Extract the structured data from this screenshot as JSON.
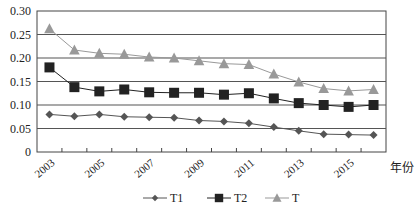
{
  "chart_data": {
    "type": "line",
    "title": "",
    "xlabel": "年份",
    "ylabel": "",
    "ylim": [
      0,
      0.3
    ],
    "yticks": [
      "0",
      "0.05",
      "0.10",
      "0.15",
      "0.20",
      "0.25",
      "0.30"
    ],
    "ytick_values": [
      0,
      0.05,
      0.1,
      0.15,
      0.2,
      0.25,
      0.3
    ],
    "x": [
      2003,
      2004,
      2005,
      2006,
      2007,
      2008,
      2009,
      2010,
      2011,
      2012,
      2013,
      2014,
      2015,
      2016
    ],
    "xtick_labels": [
      "2003",
      "2005",
      "2007",
      "2009",
      "2011",
      "2013",
      "2015"
    ],
    "grid": "horizontal",
    "legend_position": "bottom",
    "series": [
      {
        "name": "T1",
        "marker": "diamond",
        "color": "#555555",
        "values": [
          0.08,
          0.076,
          0.08,
          0.075,
          0.074,
          0.073,
          0.067,
          0.065,
          0.061,
          0.053,
          0.045,
          0.038,
          0.037,
          0.036
        ]
      },
      {
        "name": "T2",
        "marker": "square",
        "color": "#222222",
        "values": [
          0.18,
          0.138,
          0.129,
          0.133,
          0.127,
          0.126,
          0.126,
          0.122,
          0.125,
          0.114,
          0.104,
          0.1,
          0.096,
          0.1
        ]
      },
      {
        "name": "T",
        "marker": "triangle",
        "color": "#999999",
        "values": [
          0.262,
          0.217,
          0.21,
          0.208,
          0.202,
          0.2,
          0.194,
          0.188,
          0.186,
          0.166,
          0.149,
          0.135,
          0.13,
          0.133
        ]
      }
    ]
  }
}
